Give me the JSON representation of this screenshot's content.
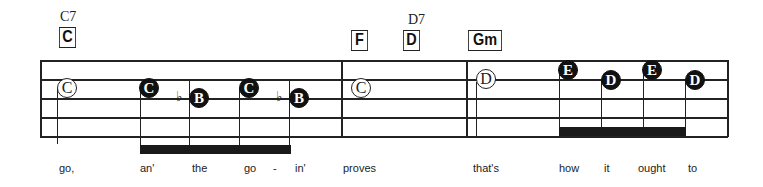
{
  "chords": [
    {
      "name": "C",
      "alt": "C7"
    },
    {
      "name": "F",
      "alt": ""
    },
    {
      "name": "D",
      "alt": "D7"
    },
    {
      "name": "Gm",
      "alt": ""
    }
  ],
  "notes": [
    {
      "letter": "C",
      "style": "open"
    },
    {
      "letter": "C",
      "style": "filled"
    },
    {
      "letter": "B",
      "style": "filled",
      "accidental": "♭"
    },
    {
      "letter": "C",
      "style": "filled"
    },
    {
      "letter": "B",
      "style": "filled",
      "accidental": "♭"
    },
    {
      "letter": "C",
      "style": "open"
    },
    {
      "letter": "D",
      "style": "open"
    },
    {
      "letter": "E",
      "style": "filled"
    },
    {
      "letter": "D",
      "style": "filled"
    },
    {
      "letter": "E",
      "style": "filled"
    },
    {
      "letter": "D",
      "style": "filled"
    }
  ],
  "lyrics": [
    "go,",
    "an'",
    "the",
    "go",
    "-",
    "in'",
    "proves",
    "that's",
    "how",
    "it",
    "ought",
    "to"
  ],
  "colors": {
    "ink": "#111111",
    "background": "#ffffff"
  }
}
